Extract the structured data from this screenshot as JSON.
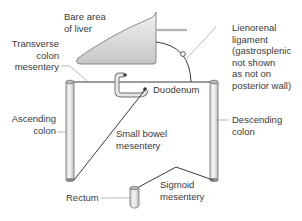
{
  "diagram": {
    "labels": {
      "bare_area_liver": "Bare area\nof liver",
      "transverse_colon_mesentery": "Transverse\ncolon\nmesentery",
      "lienorenal_ligament": "Lienorenal\nligament\n(gastrosplenic\nnot shown\nas not on\nposterior wall)",
      "duodenum": "Duodenum",
      "ascending_colon": "Ascending\ncolon",
      "descending_colon": "Descending\ncolon",
      "small_bowel_mesentery": "Small bowel\nmesentery",
      "rectum": "Rectum",
      "sigmoid_mesentery": "Sigmoid\nmesentery"
    },
    "colors": {
      "line": "#3a3a3a",
      "liver_fill_top": "#f4f4f4",
      "liver_fill_bottom": "#c8c8c8",
      "tube_fill": "#e6e6e6",
      "text": "#3a3a3a"
    }
  }
}
